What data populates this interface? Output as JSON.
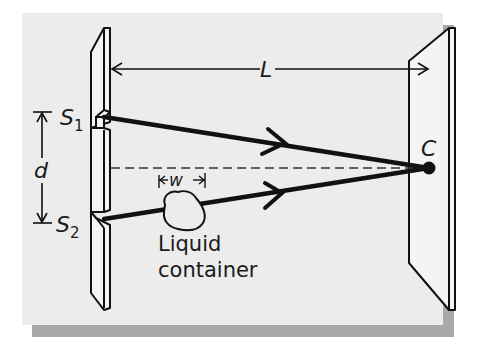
{
  "diagram": {
    "type": "double-slit interference setup",
    "labels": {
      "slit_1": "S",
      "slit_1_sub": "1",
      "slit_2": "S",
      "slit_2_sub": "2",
      "slit_separation": "d",
      "screen_distance": "L",
      "container_width": "w",
      "center_point": "C",
      "container_line1": "Liquid",
      "container_line2": "container"
    },
    "colors": {
      "background": "#ffffff",
      "panel": "#ececec",
      "shadow": "#a9a9a9",
      "ink": "#111111"
    }
  }
}
